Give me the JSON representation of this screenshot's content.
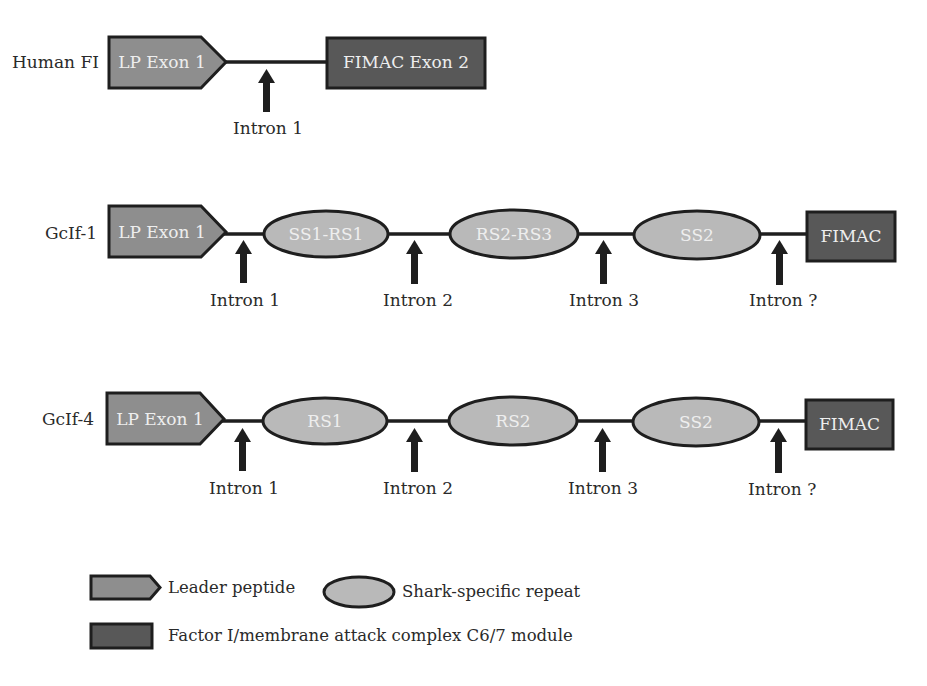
{
  "colors": {
    "leader_peptide_fill": "#8e8e8e",
    "repeat_fill": "#b9b9b9",
    "fimac_fill": "#585858",
    "outline": "#1e1e1e",
    "inner_text": "#eeeeee",
    "text": "#2a2a2a"
  },
  "rows": [
    {
      "name": "Human FI",
      "segments": [
        "LP Exon 1",
        "FIMAC Exon 2"
      ],
      "introns": [
        "Intron 1"
      ]
    },
    {
      "name": "GcIf-1",
      "segments": [
        "LP Exon 1",
        "SS1-RS1",
        "RS2-RS3",
        "SS2",
        "FIMAC"
      ],
      "introns": [
        "Intron 1",
        "Intron 2",
        "Intron 3",
        "Intron ?"
      ]
    },
    {
      "name": "GcIf-4",
      "segments": [
        "LP Exon 1",
        "RS1",
        "RS2",
        "SS2",
        "FIMAC"
      ],
      "introns": [
        "Intron 1",
        "Intron 2",
        "Intron 3",
        "Intron ?"
      ]
    }
  ],
  "legend": {
    "leader_peptide": "Leader peptide",
    "shark_repeat": "Shark-specific repeat",
    "fimac": "Factor I/membrane attack complex C6/7 module"
  }
}
